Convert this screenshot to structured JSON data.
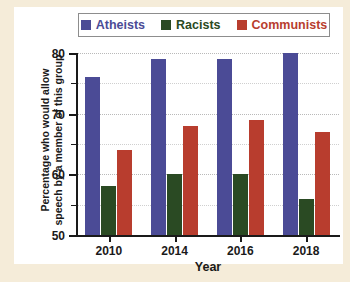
{
  "legend": {
    "entries": [
      {
        "label": "Atheists",
        "color": "#4b4b96",
        "icon": "legend-swatch-square"
      },
      {
        "label": "Racists",
        "color": "#2a4a23",
        "icon": "legend-swatch-square"
      },
      {
        "label": "Communists",
        "color": "#b83d2e",
        "icon": "legend-swatch-square"
      }
    ]
  },
  "axes": {
    "ylabel_line1": "Percentage who would allow",
    "ylabel_line2": "speech by a member of this group",
    "xlabel": "Year",
    "ytick_labels": [
      "50",
      "60",
      "70",
      "80"
    ],
    "xtick_labels": [
      "2010",
      "2014",
      "2016",
      "2018"
    ]
  },
  "chart_data": {
    "type": "bar",
    "title": "",
    "xlabel": "Year",
    "ylabel": "Percentage who would allow speech by a member of this group",
    "categories": [
      "2010",
      "2014",
      "2016",
      "2018"
    ],
    "series": [
      {
        "name": "Atheists",
        "color": "#4b4b96",
        "values": [
          76,
          79,
          79,
          80
        ]
      },
      {
        "name": "Racists",
        "color": "#2a4a23",
        "values": [
          58,
          60,
          60,
          56
        ]
      },
      {
        "name": "Communists",
        "color": "#b83d2e",
        "values": [
          64,
          68,
          69,
          67
        ]
      }
    ],
    "ylim": [
      50,
      80
    ],
    "xlim": null,
    "ymajor_ticks": [
      50,
      60,
      70,
      80
    ],
    "yminor_ticks": [
      55,
      65,
      75
    ],
    "grid": true,
    "grid_axis": "y",
    "legend_position": "top-center",
    "annotations": []
  }
}
